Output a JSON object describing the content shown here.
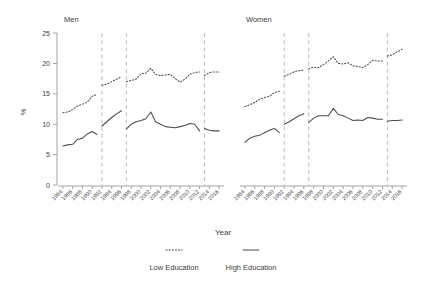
{
  "chart_data": {
    "type": "line",
    "title": "",
    "xlabel": "Year",
    "ylabel": "%",
    "ylim": [
      0,
      25
    ],
    "yticks": [
      0,
      5,
      10,
      15,
      20,
      25
    ],
    "xlim": [
      1983,
      2017
    ],
    "xticks": [
      1984,
      1986,
      1988,
      1990,
      1992,
      1994,
      1996,
      1998,
      2000,
      2002,
      2004,
      2006,
      2008,
      2010,
      2012,
      2014,
      2016
    ],
    "xtick_labels": [
      "1984",
      "1986",
      "1988",
      "1990",
      "1992",
      "1994",
      "1996",
      "1998",
      "2000",
      "2002",
      "2004",
      "2006",
      "2008",
      "2010",
      "2012",
      "2014",
      "2016"
    ],
    "xtick_rotation": 45,
    "grid": false,
    "legend_position": "bottom",
    "break_lines": [
      1992,
      1997,
      2013
    ],
    "facets": [
      {
        "name": "Men",
        "series": [
          {
            "name": "Low Education",
            "style": "dotted",
            "segments": [
              {
                "x": [
                  1984,
                  1985,
                  1986,
                  1987,
                  1988,
                  1989,
                  1990,
                  1991
                ],
                "y": [
                  11.9,
                  12.0,
                  12.4,
                  13.0,
                  13.3,
                  13.6,
                  14.6,
                  14.9
                ]
              },
              {
                "x": [
                  1992,
                  1993,
                  1994,
                  1995,
                  1996
                ],
                "y": [
                  16.4,
                  16.6,
                  17.0,
                  17.4,
                  17.8
                ]
              },
              {
                "x": [
                  1997,
                  1998,
                  1999,
                  2000,
                  2001,
                  2002,
                  2003,
                  2004,
                  2005,
                  2006,
                  2007,
                  2008,
                  2009,
                  2010,
                  2011,
                  2012
                ],
                "y": [
                  17.0,
                  17.2,
                  17.4,
                  18.3,
                  18.4,
                  19.2,
                  18.2,
                  18.0,
                  18.1,
                  18.2,
                  17.5,
                  16.9,
                  17.4,
                  18.2,
                  18.5,
                  18.6
                ]
              },
              {
                "x": [
                  2013,
                  2014,
                  2015,
                  2016
                ],
                "y": [
                  18.0,
                  18.5,
                  18.6,
                  18.6
                ]
              }
            ]
          },
          {
            "name": "High Education",
            "style": "solid",
            "segments": [
              {
                "x": [
                  1984,
                  1985,
                  1986,
                  1987,
                  1988,
                  1989,
                  1990,
                  1991
                ],
                "y": [
                  6.4,
                  6.6,
                  6.7,
                  7.5,
                  7.7,
                  8.4,
                  8.8,
                  8.3
                ]
              },
              {
                "x": [
                  1992,
                  1993,
                  1994,
                  1995,
                  1996
                ],
                "y": [
                  9.7,
                  10.4,
                  11.1,
                  11.7,
                  12.2
                ]
              },
              {
                "x": [
                  1997,
                  1998,
                  1999,
                  2000,
                  2001,
                  2002,
                  2003,
                  2004,
                  2005,
                  2006,
                  2007,
                  2008,
                  2009,
                  2010,
                  2011,
                  2012
                ],
                "y": [
                  9.2,
                  10.0,
                  10.4,
                  10.6,
                  10.9,
                  12.0,
                  10.4,
                  10.0,
                  9.6,
                  9.5,
                  9.4,
                  9.6,
                  9.8,
                  10.1,
                  10.0,
                  8.9
                ]
              },
              {
                "x": [
                  2013,
                  2014,
                  2015,
                  2016
                ],
                "y": [
                  9.3,
                  9.0,
                  8.9,
                  8.9
                ]
              }
            ]
          }
        ]
      },
      {
        "name": "Women",
        "series": [
          {
            "name": "Low Education",
            "style": "dotted",
            "segments": [
              {
                "x": [
                  1984,
                  1985,
                  1986,
                  1987,
                  1988,
                  1989,
                  1990,
                  1991
                ],
                "y": [
                  12.9,
                  13.2,
                  13.6,
                  14.1,
                  14.4,
                  14.6,
                  15.2,
                  15.4
                ]
              },
              {
                "x": [
                  1992,
                  1993,
                  1994,
                  1995,
                  1996
                ],
                "y": [
                  17.9,
                  18.2,
                  18.6,
                  18.8,
                  18.9
                ]
              },
              {
                "x": [
                  1997,
                  1998,
                  1999,
                  2000,
                  2001,
                  2002,
                  2003,
                  2004,
                  2005,
                  2006,
                  2007,
                  2008,
                  2009,
                  2010,
                  2011,
                  2012
                ],
                "y": [
                  19.1,
                  19.4,
                  19.3,
                  19.8,
                  20.4,
                  21.1,
                  20.0,
                  19.9,
                  20.1,
                  19.6,
                  19.5,
                  19.3,
                  19.8,
                  20.5,
                  20.4,
                  20.4
                ]
              },
              {
                "x": [
                  2013,
                  2014,
                  2015,
                  2016
                ],
                "y": [
                  21.2,
                  21.4,
                  21.9,
                  22.3
                ]
              }
            ]
          },
          {
            "name": "High Education",
            "style": "solid",
            "segments": [
              {
                "x": [
                  1984,
                  1985,
                  1986,
                  1987,
                  1988,
                  1989,
                  1990,
                  1991
                ],
                "y": [
                  7.0,
                  7.7,
                  8.0,
                  8.2,
                  8.6,
                  9.0,
                  9.3,
                  8.6
                ]
              },
              {
                "x": [
                  1992,
                  1993,
                  1994,
                  1995,
                  1996
                ],
                "y": [
                  10.0,
                  10.4,
                  10.9,
                  11.4,
                  11.7
                ]
              },
              {
                "x": [
                  1997,
                  1998,
                  1999,
                  2000,
                  2001,
                  2002,
                  2003,
                  2004,
                  2005,
                  2006,
                  2007,
                  2008,
                  2009,
                  2010,
                  2011,
                  2012
                ],
                "y": [
                  10.3,
                  11.0,
                  11.4,
                  11.4,
                  11.4,
                  12.6,
                  11.6,
                  11.4,
                  11.0,
                  10.6,
                  10.7,
                  10.6,
                  11.1,
                  11.0,
                  10.8,
                  10.8
                ]
              },
              {
                "x": [
                  2013,
                  2014,
                  2015,
                  2016
                ],
                "y": [
                  10.5,
                  10.6,
                  10.6,
                  10.7
                ]
              }
            ]
          }
        ]
      }
    ]
  },
  "panels": {
    "left_title": "Men",
    "right_title": "Women"
  },
  "axes": {
    "y_title": "%",
    "x_title": "Year",
    "y_tick_labels": [
      "25",
      "20",
      "15",
      "10",
      "5",
      "0"
    ]
  },
  "legend": {
    "items": [
      {
        "label": "Low Education",
        "style": "dotted"
      },
      {
        "label": "High Education",
        "style": "solid"
      }
    ]
  }
}
